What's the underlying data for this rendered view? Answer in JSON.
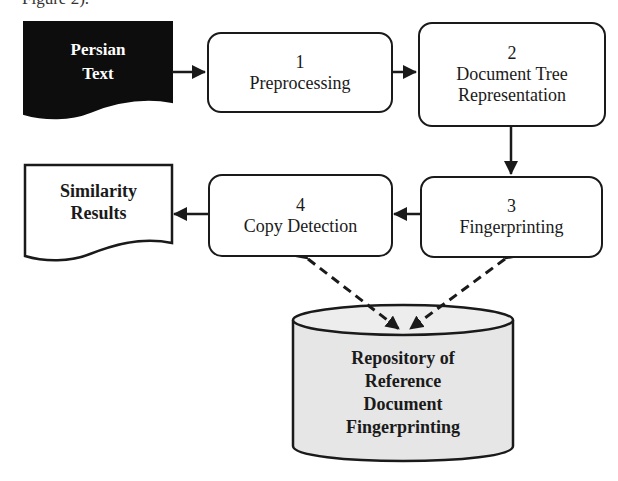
{
  "caption": "Figure 2).",
  "input": {
    "label_line1": "Persian",
    "label_line2": "Text"
  },
  "output": {
    "label_line1": "Similarity",
    "label_line2": "Results"
  },
  "steps": [
    {
      "number": "1",
      "title": "Preprocessing"
    },
    {
      "number": "2",
      "title_line1": "Document Tree",
      "title_line2": "Representation"
    },
    {
      "number": "3",
      "title": "Fingerprinting"
    },
    {
      "number": "4",
      "title": "Copy Detection"
    }
  ],
  "repository": {
    "line1": "Repository of",
    "line2": "Reference",
    "line3": "Document",
    "line4": "Fingerprinting"
  },
  "colors": {
    "input_fill": "#0d0d0d",
    "repository_fill": "#e6e6e6",
    "stroke": "#1a1a1a"
  }
}
